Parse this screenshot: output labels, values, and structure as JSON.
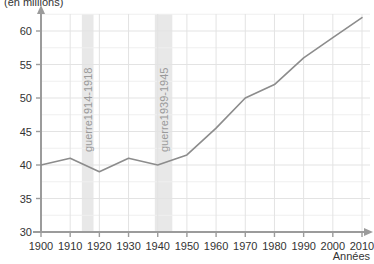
{
  "chart_data": {
    "type": "line",
    "title": "",
    "subtitle": "",
    "ylabel": "(en millions)",
    "xlabel": "Années",
    "x": [
      1900,
      1910,
      1920,
      1930,
      1940,
      1950,
      1960,
      1970,
      1980,
      1990,
      2000,
      2010
    ],
    "values": [
      40,
      41,
      39,
      41,
      40,
      41.5,
      45.5,
      50,
      52,
      56,
      59,
      62
    ],
    "series": [
      {
        "name": "Population",
        "values": [
          40,
          41,
          39,
          41,
          40,
          41.5,
          45.5,
          50,
          52,
          56,
          59,
          62
        ]
      }
    ],
    "xlim": [
      1900,
      2010
    ],
    "ylim": [
      30,
      63
    ],
    "yticks": [
      30,
      35,
      40,
      45,
      50,
      55,
      60
    ],
    "ytick_labels": [
      "30",
      "35",
      "40",
      "45",
      "50",
      "55",
      "60"
    ],
    "xticks": [
      1900,
      1910,
      1920,
      1930,
      1940,
      1950,
      1960,
      1970,
      1980,
      1990,
      2000,
      2010
    ],
    "xtick_labels": [
      "1900",
      "1910",
      "1920",
      "1930",
      "1940",
      "1950",
      "1960",
      "1970",
      "1980",
      "1990",
      "2000",
      "2010"
    ],
    "grid": true,
    "legend": "none",
    "line_color": "#8c8c8c",
    "grid_color": "#e3e3e3",
    "axis_color": "#9b9b9b",
    "band_color": "#e8e8e8",
    "annotations": [
      {
        "label": "guerre1914-1918",
        "start": 1914,
        "end": 1918,
        "orientation": "vertical"
      },
      {
        "label": "guerre1939-1945",
        "start": 1939,
        "end": 1945,
        "orientation": "vertical"
      }
    ]
  }
}
